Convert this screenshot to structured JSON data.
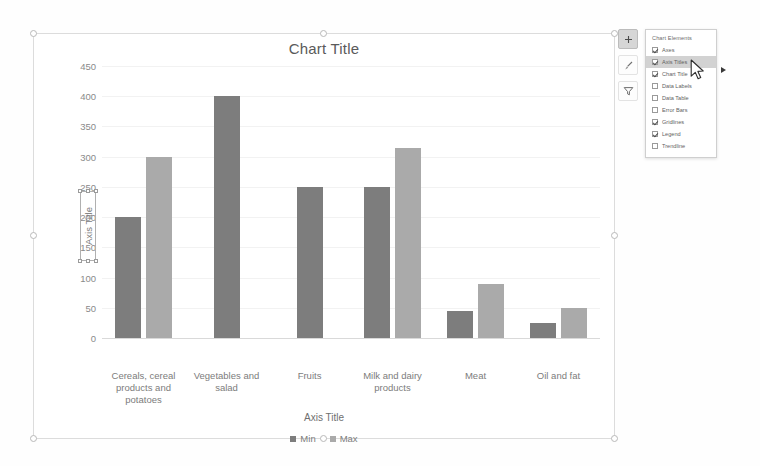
{
  "chart": {
    "title": "Chart Title",
    "x_axis_title": "Axis Title",
    "y_axis_title": "Axis Title"
  },
  "chart_data": {
    "type": "bar",
    "title": "Chart Title",
    "xlabel": "Axis Title",
    "ylabel": "Axis Title",
    "ylim": [
      0,
      450
    ],
    "yticks": [
      0,
      50,
      100,
      150,
      200,
      250,
      300,
      350,
      400,
      450
    ],
    "ytick_labels": [
      "0",
      "50",
      "100",
      "150",
      "200",
      "250",
      "300",
      "350",
      "400",
      "450"
    ],
    "grid": true,
    "legend_position": "bottom",
    "categories": [
      "Cereals, cereal products and potatoes",
      "Vegetables and salad",
      "Fruits",
      "Milk and dairy products",
      "Meat",
      "Oil and fat"
    ],
    "series": [
      {
        "name": "Min",
        "color": "#7d7d7d",
        "values": [
          200,
          400,
          250,
          250,
          45,
          25
        ]
      },
      {
        "name": "Max",
        "color": "#aaaaaa",
        "values": [
          300,
          0,
          0,
          315,
          90,
          50
        ]
      }
    ]
  },
  "side_buttons": [
    {
      "name": "chart-elements",
      "icon": "plus-icon",
      "active": true
    },
    {
      "name": "chart-styles",
      "icon": "brush-icon",
      "active": false
    },
    {
      "name": "chart-filters",
      "icon": "filter-icon",
      "active": false
    }
  ],
  "flyout": {
    "title": "Chart Elements",
    "items": [
      {
        "label": "Axes",
        "checked": true,
        "hover": false
      },
      {
        "label": "Axis Titles",
        "checked": true,
        "hover": true
      },
      {
        "label": "Chart Title",
        "checked": true,
        "hover": false
      },
      {
        "label": "Data Labels",
        "checked": false,
        "hover": false
      },
      {
        "label": "Data Table",
        "checked": false,
        "hover": false
      },
      {
        "label": "Error Bars",
        "checked": false,
        "hover": false
      },
      {
        "label": "Gridlines",
        "checked": true,
        "hover": false
      },
      {
        "label": "Legend",
        "checked": true,
        "hover": false
      },
      {
        "label": "Trendline",
        "checked": false,
        "hover": false
      }
    ]
  },
  "colors": {
    "series_min": "#7d7d7d",
    "series_max": "#aaaaaa",
    "text": "#7c7c7c",
    "grid": "#f2f2f2"
  }
}
